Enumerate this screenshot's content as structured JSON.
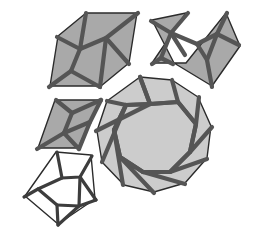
{
  "figure": {
    "background_color": "#ffffff",
    "canvas": {
      "width": 254,
      "height": 240
    }
  },
  "palette": {
    "fill_medium_gray": "#a9a9a9",
    "fill_light_gray": "#cccccc",
    "fill_white": "#ffffff",
    "outline_stroke": "#2b2b2b",
    "strap_stroke": "#555555",
    "strap_stroke_dark": "#3d3d3d"
  },
  "tiles": [
    {
      "id": "elongated-hexagon",
      "name": "Elongated Hexagon",
      "sides": 6,
      "fill": "#a9a9a9",
      "outline": "#2b2b2b",
      "strapwork": "zigzag-star",
      "outline_points": "58,36 86,13 137,13 129,63 101,86 50,86",
      "strap_paths": [
        "M 58,36 L 78,50 L 72,70 L 50,86",
        "M 86,13 L 78,50 L 104,38 L 101,86",
        "M 137,13 L 104,38 L 129,63",
        "M 78,50 L 72,70 L 101,86",
        "M 72,70 L 50,86"
      ]
    },
    {
      "id": "bowtie",
      "name": "Bowtie",
      "sides": 6,
      "fill": "#a9a9a9",
      "outline": "#2b2b2b",
      "strapwork": "double-star",
      "outline_points": "152,20 186,13 152,63 186,63 226,13 240,46 212,86 174,63",
      "strap_paths": [
        "M 152,20 L 172,32 L 162,57",
        "M 186,13 L 172,32 L 186,56",
        "M 172,32 L 196,43 L 216,33",
        "M 226,13 L 216,33 L 238,44",
        "M 216,33 L 206,60 L 212,86",
        "M 206,60 L 196,43"
      ]
    },
    {
      "id": "rhombus",
      "name": "Rhombus",
      "sides": 4,
      "fill": "#a9a9a9",
      "outline": "#2b2b2b",
      "strapwork": "hourglass",
      "outline_points": "55,100 100,100 78,148 38,148"
    },
    {
      "id": "pentagon",
      "name": "Regular Pentagon",
      "sides": 5,
      "fill": "#ffffff",
      "outline": "#2b2b2b",
      "strapwork": "five-point-star",
      "outline_points": "56,152 91,155 95,199 58,224 25,196"
    },
    {
      "id": "decagon",
      "name": "Decagon",
      "sides": 10,
      "fill": "#cccccc",
      "outline": "#2b2b2b",
      "strapwork": "ten-point-star",
      "outline_points": "140,77 172,80 198,97 211,126 207,158 185,183 154,192 124,185 102,162 97,131 107,101"
    }
  ]
}
